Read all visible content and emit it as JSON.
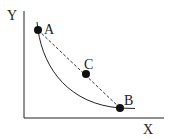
{
  "diagram": {
    "axes": {
      "x_label": "X",
      "y_label": "Y"
    },
    "points": [
      {
        "id": "A",
        "label": "A",
        "x": 38,
        "y": 30
      },
      {
        "id": "C",
        "label": "C",
        "x": 86,
        "y": 74
      },
      {
        "id": "B",
        "label": "B",
        "x": 120,
        "y": 108
      }
    ],
    "curve": "convex curve from A to B",
    "dashed_line": "A to B through C",
    "colors": {
      "stroke": "#222222",
      "background": "#ffffff"
    }
  }
}
